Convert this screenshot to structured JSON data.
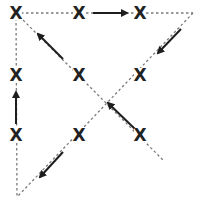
{
  "diagram": {
    "type": "triangular path diagram",
    "colors": {
      "line": "#7a7a7a",
      "arrow": "#1e1e1e",
      "mark": "#222222",
      "background": "#ffffff"
    },
    "marker_symbol": "X",
    "vertices": {
      "top_left": [
        16,
        13
      ],
      "top_right": [
        193,
        13
      ],
      "bottom_left": [
        17,
        197
      ],
      "diagonal_end": [
        163,
        160
      ]
    },
    "dashed_lines": [
      {
        "name": "top-edge",
        "from": [
          16,
          13
        ],
        "to": [
          193,
          13
        ]
      },
      {
        "name": "left-edge",
        "from": [
          16,
          13
        ],
        "to": [
          17,
          197
        ]
      },
      {
        "name": "right-hypotenuse",
        "from": [
          193,
          13
        ],
        "to": [
          17,
          197
        ]
      },
      {
        "name": "main-diagonal",
        "from": [
          16,
          13
        ],
        "to": [
          163,
          160
        ]
      }
    ],
    "marks": [
      {
        "name": "mark-top-left",
        "x": 16,
        "y": 13,
        "label": "X"
      },
      {
        "name": "mark-top-middle",
        "x": 79,
        "y": 13,
        "label": "X"
      },
      {
        "name": "mark-top-right",
        "x": 140,
        "y": 13,
        "label": "X"
      },
      {
        "name": "mark-middle-left",
        "x": 16,
        "y": 75,
        "label": "X"
      },
      {
        "name": "mark-middle-center",
        "x": 79,
        "y": 75,
        "label": "X"
      },
      {
        "name": "mark-middle-right",
        "x": 140,
        "y": 75,
        "label": "X"
      },
      {
        "name": "mark-lower-left",
        "x": 16,
        "y": 135,
        "label": "X"
      },
      {
        "name": "mark-lower-center",
        "x": 79,
        "y": 135,
        "label": "X"
      },
      {
        "name": "mark-lower-right",
        "x": 140,
        "y": 135,
        "label": "X"
      }
    ],
    "arrows": [
      {
        "name": "arrow-right-top",
        "from": [
          93,
          13
        ],
        "to": [
          127,
          13
        ],
        "direction": "right"
      },
      {
        "name": "arrow-down-left-upper",
        "from": [
          181,
          29
        ],
        "to": [
          158,
          53
        ],
        "direction": "down-left"
      },
      {
        "name": "arrow-up-left-diagonal",
        "from": [
          63,
          59
        ],
        "to": [
          38,
          34
        ],
        "direction": "up-left"
      },
      {
        "name": "arrow-up-left-lower",
        "from": [
          135,
          129
        ],
        "to": [
          108,
          103
        ],
        "direction": "up-left"
      },
      {
        "name": "arrow-up-left-edge",
        "from": [
          16,
          124
        ],
        "to": [
          16,
          92
        ],
        "direction": "up"
      },
      {
        "name": "arrow-down-left-lower",
        "from": [
          63,
          152
        ],
        "to": [
          40,
          177
        ],
        "direction": "down-left"
      }
    ]
  }
}
